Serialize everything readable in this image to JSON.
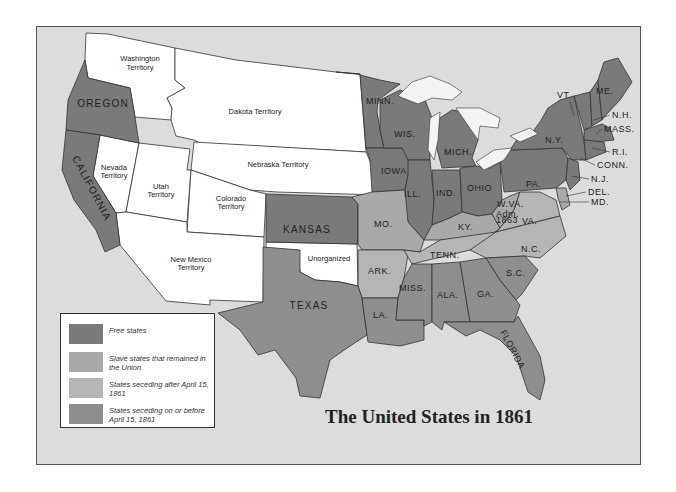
{
  "map": {
    "title": "The United States in 1861",
    "colors": {
      "free": "#7a7a7a",
      "slave_union": "#a9a9a9",
      "seceding_after": "#b5b5b5",
      "seceding_before": "#8e8e8e",
      "territory": "#ffffff",
      "water": "#dcdcdc",
      "lakes": "#f4f4f4"
    },
    "legend": [
      {
        "key": "free",
        "label": "Free states"
      },
      {
        "key": "slave_union",
        "label": "Slave states that remained in the Union"
      },
      {
        "key": "seceding_after",
        "label": "States seceding after April 15, 1861"
      },
      {
        "key": "seceding_before",
        "label": "States seceding on or before April 15, 1861"
      }
    ],
    "labels": {
      "washington": [
        "Washington",
        "Territory"
      ],
      "oregon": "OREGON",
      "california": "CALIFORNIA",
      "nevada": [
        "Nevada",
        "Territory"
      ],
      "utah": [
        "Utah",
        "Territory"
      ],
      "colorado": [
        "Colorado",
        "Territory"
      ],
      "dakota": "Dakota Territory",
      "nebraska": "Nebraska Territory",
      "new_mexico": [
        "New Mexico",
        "Territory"
      ],
      "unorganized": "Unorganized",
      "kansas": "KANSAS",
      "texas": "TEXAS",
      "minn": "MINN.",
      "iowa": "IOWA",
      "wis": "WIS.",
      "mich": "MICH.",
      "ill": "ILL.",
      "ind": "IND.",
      "ohio": "OHIO",
      "mo": "MO.",
      "ark": "ARK.",
      "la": "LA.",
      "miss": "MISS.",
      "ala": "ALA.",
      "ga": "GA.",
      "florida": "FLORIDA",
      "sc": "S.C.",
      "nc": "N.C.",
      "tenn": "TENN.",
      "ky": "KY.",
      "va": "VA.",
      "wva": "W.VA.",
      "wva_note": [
        "Adm.",
        "1863"
      ],
      "pa": "PA.",
      "ny": "N.Y.",
      "vt": "VT.",
      "me": "ME.",
      "nh": "N.H.",
      "mass": "MASS.",
      "ri": "R.I.",
      "conn": "CONN.",
      "nj": "N.J.",
      "del": "DEL.",
      "md": "MD."
    }
  }
}
